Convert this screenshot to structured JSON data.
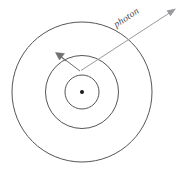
{
  "diagram": {
    "labels": {
      "photon": "photon"
    },
    "colors": {
      "background": "#ffffff",
      "orbit_stroke": "#55555a",
      "nucleus": "#1a1a1a",
      "photon_ray": "#9a9a9e",
      "electron_ray": "#6e6e73",
      "label_text": "#4a4a4f"
    },
    "center": {
      "x": 82,
      "y": 92
    },
    "orbits": [
      {
        "name": "inner-orbit",
        "radius": 17
      },
      {
        "name": "middle-orbit",
        "radius": 36.5
      },
      {
        "name": "outer-orbit",
        "radius": 70
      }
    ],
    "nucleus": {
      "radius": 2
    },
    "photon_arrow": {
      "from": {
        "x": 174,
        "y": 10
      },
      "to": {
        "x": 80,
        "y": 71
      },
      "label_rotation_deg": -33
    },
    "electron_arrow": {
      "from": {
        "x": 79,
        "y": 70
      },
      "to": {
        "x": 56,
        "y": 53
      }
    }
  }
}
